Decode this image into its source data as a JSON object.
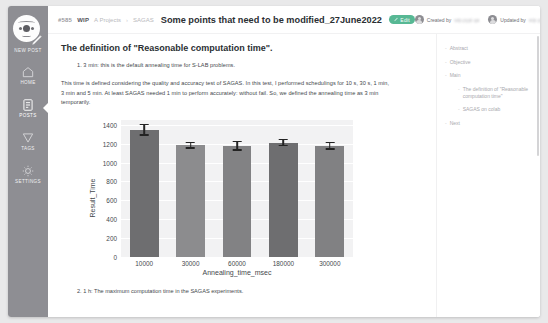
{
  "sidebar": {
    "logo_name": "app-logo",
    "new_post_label": "NEW POST",
    "items": [
      {
        "label": "HOME",
        "icon": "home-icon",
        "active": false
      },
      {
        "label": "POSTS",
        "icon": "posts-icon",
        "active": true
      },
      {
        "label": "TAGS",
        "icon": "tags-icon",
        "active": false
      },
      {
        "label": "SETTINGS",
        "icon": "gear-icon",
        "active": false
      }
    ]
  },
  "topbar": {
    "post_id": "#585",
    "status": "WIP",
    "breadcrumb_project": "A Projects",
    "breadcrumb_sep": "›",
    "breadcrumb_item": "SAGAS",
    "title": "Some points that need to be modified_27June2022",
    "edit_label": "Edit",
    "edit_icon": "pencil-icon",
    "accent_color": "#57b894",
    "created_label": "Created by",
    "created_user": "wip.pypi.qa",
    "updated_label": "Updated by",
    "updated_user": "wip.pypi.qa"
  },
  "document": {
    "heading": "The definition of \"Reasonable computation time\".",
    "list_item_1": "1. 3 min: this is the default annealing time for S-LAB problems.",
    "paragraph": "This time is defined considering the quality and accuracy test of SAGAS. In this test, I performed schedulings for 10 s, 30 s, 1 min, 3 min and 5 min. At least SAGAS needed 1 min to perform accurately: without fail. So, we defined the annealing time as 3 min temporarily.",
    "list_item_2": "2. 1 h: The maximum computation time in the SAGAS experiments."
  },
  "chart_data": {
    "type": "bar",
    "title": "",
    "xlabel": "Annealing_time_msec",
    "ylabel": "Result_Time",
    "categories": [
      "10000",
      "30000",
      "60000",
      "180000",
      "300000"
    ],
    "values": [
      1350,
      1185,
      1180,
      1215,
      1180
    ],
    "errors": [
      65,
      40,
      55,
      40,
      45
    ],
    "yticks": [
      0,
      200,
      400,
      600,
      800,
      1000,
      1200,
      1400
    ],
    "ylim": [
      0,
      1460
    ],
    "grid": true,
    "legend": "none",
    "bar_colors": [
      "#6e6e70",
      "#8c8c8e",
      "#828284",
      "#6e6e70",
      "#818183"
    ],
    "plot_bg": "#f2f2f3",
    "error_color": "#232323"
  },
  "toc": {
    "items": [
      {
        "label": "Abstract",
        "sub": false
      },
      {
        "label": "Objective",
        "sub": false
      },
      {
        "label": "Main",
        "sub": false
      },
      {
        "label": "The definition of \"Reasonable computation time\"",
        "sub": true
      },
      {
        "label": "SAGAS on colab",
        "sub": true
      },
      {
        "label": "Next",
        "sub": false
      }
    ]
  }
}
